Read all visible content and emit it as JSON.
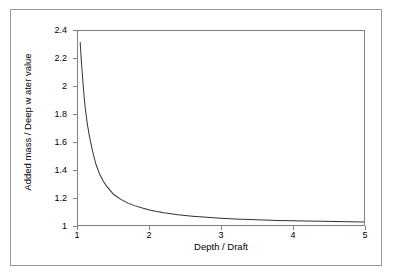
{
  "chart_data": {
    "type": "line",
    "title": "",
    "subtitle": "",
    "xlabel": "Depth / Draft",
    "ylabel": "Added mass / Deep w ater value",
    "xlim": [
      1,
      5
    ],
    "ylim": [
      1,
      2.4
    ],
    "xticks": [
      "1",
      "2",
      "3",
      "4",
      "5"
    ],
    "xtick_values": [
      1,
      2,
      3,
      4,
      5
    ],
    "yticks": [
      "1",
      "1.2",
      "1.4",
      "1.6",
      "1.8",
      "2",
      "2.2",
      "2.4"
    ],
    "ytick_values": [
      1,
      1.2,
      1.4,
      1.6,
      1.8,
      2,
      2.2,
      2.4
    ],
    "grid": false,
    "legend": false,
    "legend_position": "none",
    "line_color": "#333333",
    "plot_border_color": "#808080",
    "figure_border_color": "#9a9a9a",
    "background": "#ffffff",
    "series": [
      {
        "name": "Added mass ratio",
        "x": [
          1.03,
          1.05,
          1.08,
          1.1,
          1.13,
          1.16,
          1.2,
          1.25,
          1.3,
          1.35,
          1.4,
          1.45,
          1.5,
          1.6,
          1.7,
          1.8,
          1.9,
          2.0,
          2.1,
          2.2,
          2.4,
          2.6,
          2.8,
          3.0,
          3.2,
          3.4,
          3.6,
          3.8,
          4.0,
          4.2,
          4.4,
          4.6,
          4.8,
          5.0
        ],
        "y": [
          2.32,
          2.16,
          1.96,
          1.85,
          1.73,
          1.64,
          1.54,
          1.44,
          1.37,
          1.32,
          1.28,
          1.25,
          1.22,
          1.185,
          1.158,
          1.138,
          1.122,
          1.108,
          1.097,
          1.088,
          1.074,
          1.064,
          1.056,
          1.049,
          1.044,
          1.04,
          1.036,
          1.033,
          1.031,
          1.029,
          1.027,
          1.025,
          1.023,
          1.021
        ]
      }
    ]
  }
}
